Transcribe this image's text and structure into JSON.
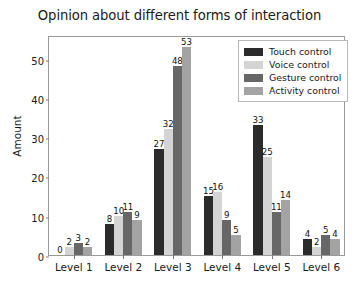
{
  "chart_data": {
    "type": "bar",
    "title": "Opinion about different forms of interaction",
    "xlabel": "",
    "ylabel": "Amount",
    "categories": [
      "Level 1",
      "Level 2",
      "Level 3",
      "Level 4",
      "Level 5",
      "Level 6"
    ],
    "series": [
      {
        "name": "Touch control",
        "color": "#2b2b2b",
        "values": [
          0,
          8,
          27,
          15,
          33,
          4
        ]
      },
      {
        "name": "Voice control",
        "color": "#d4d4d4",
        "values": [
          2,
          10,
          32,
          16,
          25,
          2
        ]
      },
      {
        "name": "Gesture control",
        "color": "#676767",
        "values": [
          3,
          11,
          48,
          9,
          11,
          5
        ]
      },
      {
        "name": "Activity control",
        "color": "#a3a3a3",
        "values": [
          2,
          9,
          53,
          5,
          14,
          4
        ]
      }
    ],
    "ylim": [
      0,
      56
    ],
    "yticks": [
      0,
      10,
      20,
      30,
      40,
      50
    ],
    "ytick_labels": [
      "0",
      "10",
      "20",
      "30",
      "40",
      "50"
    ],
    "grid": false,
    "legend_position": "upper right",
    "show_value_labels": true
  }
}
